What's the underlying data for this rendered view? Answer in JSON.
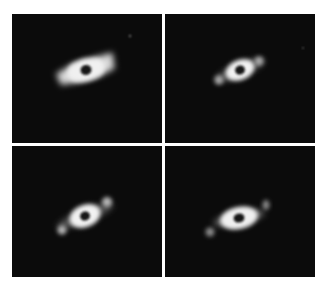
{
  "figure": {
    "panel_count": 4,
    "colors": {
      "background": "#ffffff",
      "sky": "#0b0b0b",
      "planet_glow": "#f2f2f2",
      "planet_core": "#1a1a1a"
    },
    "panels": [
      {
        "id": "top-left",
        "subject": "ringed planet with broad ring extensions",
        "satellites": 0,
        "field_star": true
      },
      {
        "id": "top-right",
        "subject": "ringed planet with two satellites aligned with ring plane",
        "satellites": 2,
        "field_star": true
      },
      {
        "id": "bottom-left",
        "subject": "ringed planet with two satellites aligned with ring plane",
        "satellites": 2,
        "field_star": false
      },
      {
        "id": "bottom-right",
        "subject": "ringed planet with two faint satellites aligned with ring plane",
        "satellites": 2,
        "field_star": false
      }
    ]
  }
}
